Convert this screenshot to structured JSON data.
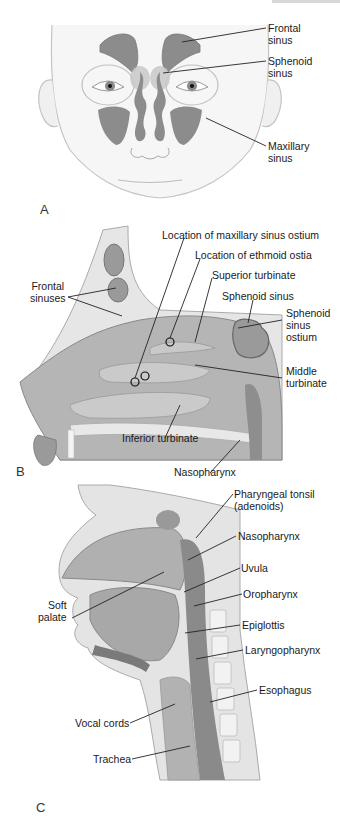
{
  "colors": {
    "skin": "#f4f4f4",
    "outline": "#b8b8b8",
    "sinus": "#8a8a8a",
    "sinus_dark": "#6e6e6e",
    "tissue": "#b5b5b5",
    "tissue_light": "#cfcfcf",
    "bone": "#e6e6e6",
    "leader": "#222222"
  },
  "panels": {
    "a": {
      "letter": "A",
      "labels": {
        "frontal_1": "Frontal",
        "frontal_2": "sinus",
        "sphenoid_1": "Sphenoid",
        "sphenoid_2": "sinus",
        "maxillary_1": "Maxillary",
        "maxillary_2": "sinus"
      }
    },
    "b": {
      "letter": "B",
      "labels": {
        "frontal_1": "Frontal",
        "frontal_2": "sinuses",
        "maxillary_ostium": "Location of maxillary sinus ostium",
        "ethmoid_ostia": "Location of ethmoid ostia",
        "superior_turbinate": "Superior turbinate",
        "sphenoid_sinus": "Sphenoid sinus",
        "sphenoid_ostium_1": "Sphenoid",
        "sphenoid_ostium_2": "sinus",
        "sphenoid_ostium_3": "ostium",
        "middle_turbinate_1": "Middle",
        "middle_turbinate_2": "turbinate",
        "inferior_turbinate": "Inferior turbinate",
        "nasopharynx": "Nasopharynx"
      }
    },
    "c": {
      "letter": "C",
      "labels": {
        "pharyngeal_tonsil_1": "Pharyngeal tonsil",
        "pharyngeal_tonsil_2": "(adenoids)",
        "nasopharynx": "Nasopharynx",
        "uvula": "Uvula",
        "soft_palate_1": "Soft",
        "soft_palate_2": "palate",
        "oropharynx": "Oropharynx",
        "epiglottis": "Epiglottis",
        "laryngopharynx": "Laryngopharynx",
        "esophagus": "Esophagus",
        "vocal_cords": "Vocal cords",
        "trachea": "Trachea"
      }
    }
  }
}
